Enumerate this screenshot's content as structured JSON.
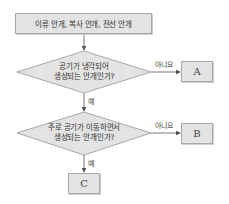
{
  "diagram": {
    "type": "flowchart",
    "start": {
      "label": "이류 안개, 복사 안개, 전선 안개"
    },
    "decisions": [
      {
        "line1": "공기가 냉각되어",
        "line2": "생성되는 안개인가?",
        "no_label": "아니요",
        "yes_label": "예"
      },
      {
        "line1": "주로 공기가 이동하면서",
        "line2": "생성되는 안개인가?",
        "no_label": "아니요",
        "yes_label": "예"
      }
    ],
    "outcomes": {
      "a": "A",
      "b": "B",
      "c": "C"
    },
    "colors": {
      "fill": "#e3e3e3",
      "stroke": "#a8a8a8",
      "arrow": "#555555"
    }
  }
}
